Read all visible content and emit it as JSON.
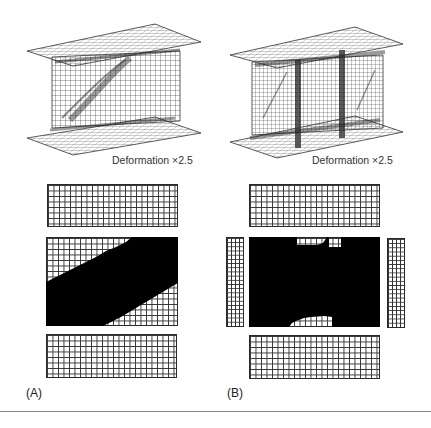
{
  "figure": {
    "panels": [
      {
        "id": "A",
        "label": "(A)",
        "caption": "Deformation ×2.5",
        "description": "Deformed I-girder mesh without intermediate stiffeners; diagonal tension field in web",
        "plan_views": [
          "top-flange",
          "web",
          "bottom-flange"
        ],
        "yielded_region": "diagonal band across web"
      },
      {
        "id": "B",
        "label": "(B)",
        "caption": "Deformation ×2.5",
        "description": "Deformed I-girder mesh with two transverse stiffeners",
        "plan_views": [
          "top-flange",
          "left-stiffener",
          "web",
          "right-stiffener",
          "bottom-flange"
        ],
        "yielded_region": "nearly entire web except notches at top-center and bottom-center"
      }
    ]
  },
  "colors": {
    "mesh": "#333333",
    "yielded": "#000000",
    "background": "#ffffff",
    "divider": "#888888"
  }
}
